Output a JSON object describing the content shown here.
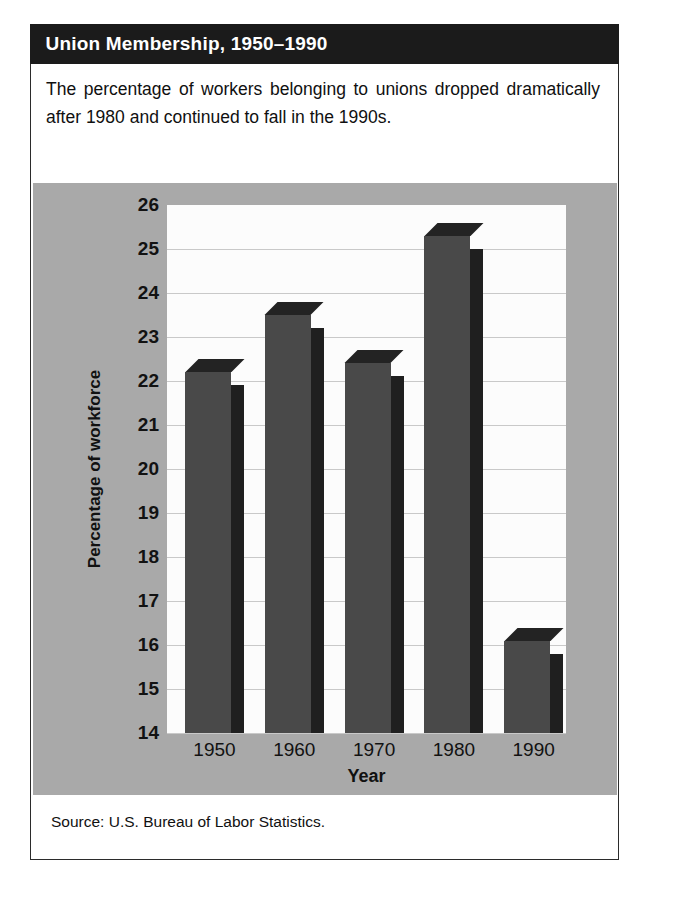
{
  "figure": {
    "title": "Union Membership, 1950–1990",
    "caption": "The percentage of workers belonging to unions dropped dramatically after 1980 and continued to fall in the 1990s.",
    "source": "Source: U.S. Bureau of Labor Statistics."
  },
  "colors": {
    "title_bar": "#1b1b1b",
    "title_text": "#ffffff",
    "chart_panel": "#a9a9a9",
    "plot_background": "#fcfcfc",
    "gridline": "#c9c9c9",
    "bar_front": "#494949",
    "bar_side": "#1f1f1f",
    "bar_top": "#232323",
    "border": "#2b2b2b"
  },
  "chart_data": {
    "type": "bar",
    "title": "Union Membership, 1950–1990",
    "xlabel": "Year",
    "ylabel": "Percentage of workforce",
    "categories": [
      "1950",
      "1960",
      "1970",
      "1980",
      "1990"
    ],
    "values": [
      22.2,
      23.5,
      22.4,
      25.3,
      16.1
    ],
    "ylim": [
      14,
      26
    ],
    "yticks": [
      14,
      15,
      16,
      17,
      18,
      19,
      20,
      21,
      22,
      23,
      24,
      25,
      26
    ],
    "ytick_labels": [
      "14",
      "15",
      "16",
      "17",
      "18",
      "19",
      "20",
      "21",
      "22",
      "23",
      "24",
      "25",
      "26"
    ],
    "grid": true,
    "legend": "none",
    "style": "3d-column"
  }
}
